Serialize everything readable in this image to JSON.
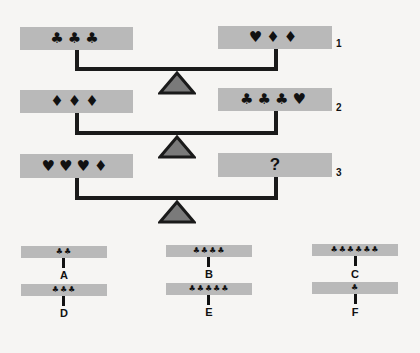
{
  "puzzle": {
    "balances": [
      {
        "id": "1",
        "label": "1",
        "left": "♣♣♣",
        "right": "♥♦♦"
      },
      {
        "id": "2",
        "label": "2",
        "left": "♦♦♦",
        "right": "♣♣♣♥"
      },
      {
        "id": "3",
        "label": "3",
        "left": "♥♥♥♦",
        "right": "?"
      }
    ],
    "options": [
      {
        "letter": "A",
        "symbols": "♣♣"
      },
      {
        "letter": "B",
        "symbols": "♣♣♣♣"
      },
      {
        "letter": "C",
        "symbols": "♣♣♣♣♣♣"
      },
      {
        "letter": "D",
        "symbols": "♣♣♣"
      },
      {
        "letter": "E",
        "symbols": "♣♣♣♣♣"
      },
      {
        "letter": "F",
        "symbols": "♣"
      }
    ]
  },
  "colors": {
    "pan": "#b9b9b9",
    "beam": "#1a1a1a",
    "fulcrum_fill": "#7a7a7a",
    "background": "#f6f5f3"
  }
}
